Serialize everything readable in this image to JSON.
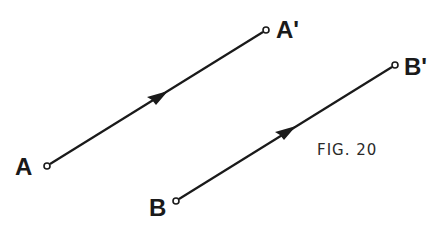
{
  "figure": {
    "caption": "FIG. 20",
    "colors": {
      "ink": "#1a1a1a",
      "background": "#ffffff"
    },
    "vectors": [
      {
        "name": "AA'",
        "start": {
          "label": "A",
          "x": 47,
          "y": 166
        },
        "end": {
          "label": "A'",
          "x": 266,
          "y": 30
        },
        "arrow_at": {
          "x": 163,
          "y": 94
        }
      },
      {
        "name": "BB'",
        "start": {
          "label": "B",
          "x": 176,
          "y": 201
        },
        "end": {
          "label": "B'",
          "x": 395,
          "y": 65
        },
        "arrow_at": {
          "x": 291,
          "y": 129
        }
      }
    ]
  }
}
